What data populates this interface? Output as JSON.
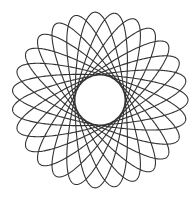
{
  "figure": {
    "type": "hypotrochoid",
    "petals": 15,
    "center": [
      100,
      100
    ],
    "outer_radius": 88,
    "inner_radius": 25,
    "stroke_color": "#333333",
    "background_color": "#ffffff"
  }
}
